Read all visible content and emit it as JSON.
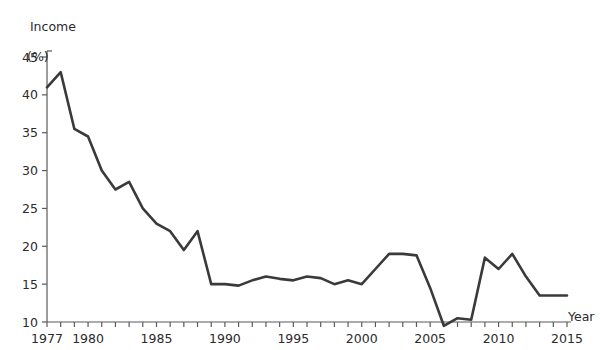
{
  "chart_data": {
    "type": "line",
    "title": "",
    "xlabel": "Year",
    "ylabel": "Income (%)",
    "ylabel_name": "Income",
    "ylabel_unit": "(%)",
    "xlim": [
      1977,
      2015
    ],
    "ylim": [
      8.5,
      45
    ],
    "grid": false,
    "legend": null,
    "yticks": [
      10,
      15,
      20,
      25,
      30,
      35,
      40,
      45
    ],
    "ytick_labels": [
      "10",
      "15",
      "20",
      "25",
      "30",
      "35",
      "40",
      "45"
    ],
    "xticks": [
      1977,
      1980,
      1985,
      1990,
      1995,
      2000,
      2005,
      2010,
      2015
    ],
    "xtick_labels": [
      "1977",
      "1980",
      "1985",
      "1990",
      "1995",
      "2000",
      "2005",
      "2010",
      "2015"
    ],
    "x_minor_tick_step": 1,
    "line_color": "#3a3a3a",
    "line_width": 2.6,
    "x": [
      1977,
      1978,
      1979,
      1980,
      1981,
      1982,
      1983,
      1984,
      1985,
      1986,
      1987,
      1988,
      1989,
      1990,
      1991,
      1992,
      1993,
      1994,
      1995,
      1996,
      1997,
      1998,
      1999,
      2000,
      2001,
      2002,
      2003,
      2004,
      2005,
      2006,
      2007,
      2008,
      2009,
      2010,
      2011,
      2012,
      2013,
      2014,
      2015
    ],
    "values": [
      41.0,
      43.0,
      35.5,
      34.5,
      30.0,
      27.5,
      28.5,
      25.0,
      23.0,
      22.0,
      19.5,
      22.0,
      15.0,
      15.0,
      14.8,
      15.5,
      16.0,
      15.7,
      15.5,
      16.0,
      15.8,
      15.0,
      15.5,
      15.0,
      17.0,
      19.0,
      19.0,
      18.8,
      14.5,
      9.5,
      10.5,
      10.3,
      18.5,
      17.0,
      19.0,
      16.0,
      13.5,
      13.5,
      13.5
    ]
  }
}
